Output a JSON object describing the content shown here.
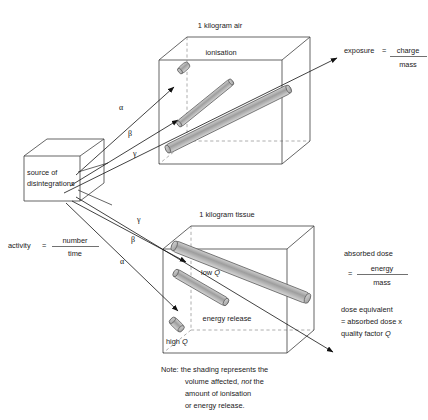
{
  "diagram": {
    "title_air": "1 kilogram air",
    "title_tissue": "1 kilogram tissue",
    "source_label_line1": "source of",
    "source_label_line2": "disintegrations",
    "ionisation_label": "ionisation",
    "energy_release_label": "energy release",
    "low_q_prefix": "low ",
    "low_q_symbol": "Q",
    "high_q_prefix": "high ",
    "high_q_symbol": "Q"
  },
  "rays": {
    "air": [
      {
        "name": "alpha",
        "glyph": "α"
      },
      {
        "name": "beta",
        "glyph": "β"
      },
      {
        "name": "gamma",
        "glyph": "γ"
      }
    ],
    "tissue": [
      {
        "name": "gamma",
        "glyph": "γ"
      },
      {
        "name": "beta",
        "glyph": "β"
      },
      {
        "name": "alpha",
        "glyph": "α"
      }
    ]
  },
  "formulas": {
    "activity": {
      "lhs": "activity",
      "equals": "=",
      "numerator": "number",
      "denominator": "time"
    },
    "exposure": {
      "lhs": "exposure",
      "equals": "=",
      "numerator": "charge",
      "denominator": "mass"
    },
    "absorbed_dose": {
      "lhs": "absorbed dose",
      "equals": "=",
      "numerator": "energy",
      "denominator": "mass"
    },
    "dose_equivalent": {
      "line1": "dose equivalent",
      "line2": "= absorbed dose x",
      "line3_prefix": "quality factor ",
      "line3_symbol": "Q"
    }
  },
  "note": {
    "lines": [
      {
        "pre": "Note: the shading represents the",
        "em": "",
        "post": ""
      },
      {
        "pre": "volume affected, ",
        "em": "not",
        "post": " the"
      },
      {
        "pre": "amount of ionisation",
        "em": "",
        "post": ""
      },
      {
        "pre": "or energy release.",
        "em": "",
        "post": ""
      }
    ]
  },
  "colors": {
    "edge": "#4a4a4a",
    "hidden_edge": "#9a9a9a",
    "ray": "#111111",
    "track_fill": "#b5b5b5",
    "track_stroke": "#5f5f5f",
    "text": "#1a1a1a",
    "background": "#ffffff"
  }
}
